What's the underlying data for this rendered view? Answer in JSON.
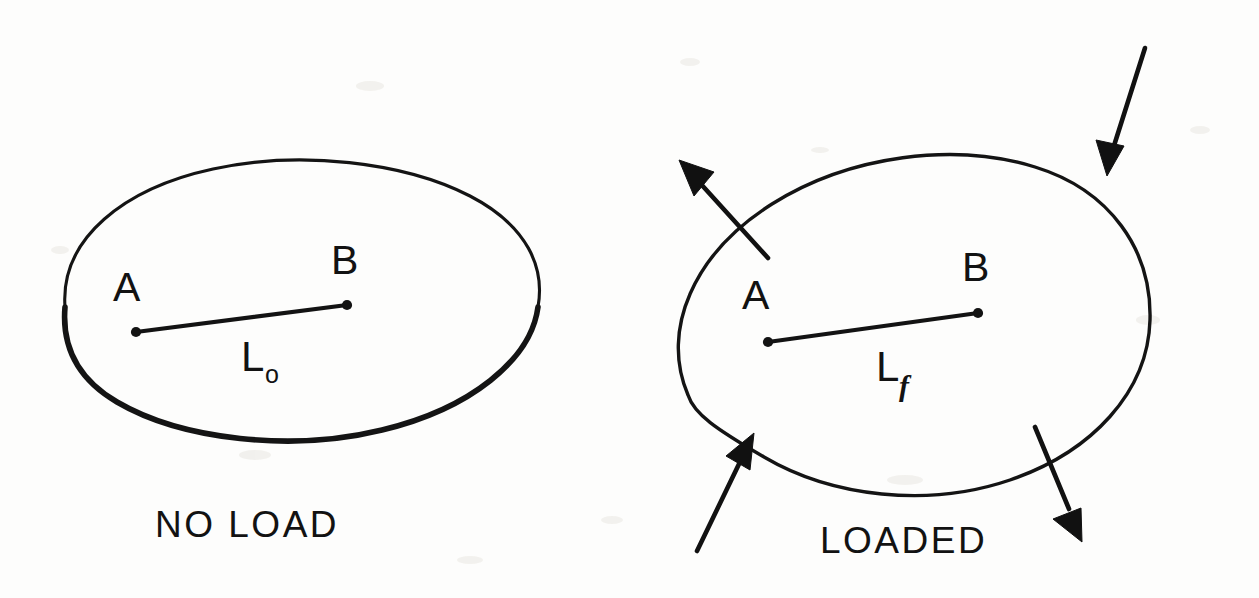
{
  "figure": {
    "background_color": "#fdfdfc",
    "ink_color": "#121212"
  },
  "panels": [
    {
      "id": "no-load",
      "caption": "NO LOAD",
      "point_a_label": "A",
      "point_b_label": "B",
      "length_symbol": "L",
      "length_subscript": "o",
      "length_label_full": "Lo",
      "arrows": []
    },
    {
      "id": "loaded",
      "caption": "LOADED",
      "point_a_label": "A",
      "point_b_label": "B",
      "length_symbol": "L",
      "length_subscript": "f",
      "length_label_full": "Lf",
      "arrows": [
        {
          "name": "arrow-top-right-inward",
          "direction": "inward",
          "orientation": "down-left"
        },
        {
          "name": "arrow-upper-left-outward",
          "direction": "outward",
          "orientation": "up-left"
        },
        {
          "name": "arrow-lower-left-inward",
          "direction": "inward",
          "orientation": "up-right"
        },
        {
          "name": "arrow-lower-right-outward",
          "direction": "outward",
          "orientation": "down-right"
        }
      ]
    }
  ]
}
